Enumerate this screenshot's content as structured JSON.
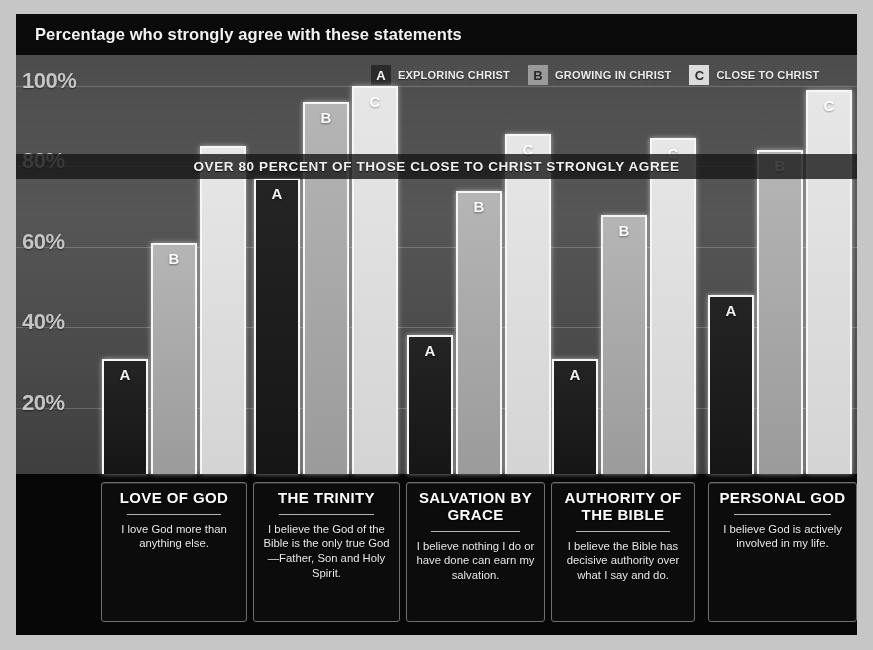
{
  "header": {
    "title": "Percentage who strongly agree with these statements"
  },
  "banner": {
    "text": "OVER 80 PERCENT OF THOSE CLOSE TO CHRIST STRONGLY AGREE"
  },
  "legend": [
    {
      "key": "A",
      "label": "EXPLORING CHRIST",
      "color": "#2a2a2a"
    },
    {
      "key": "B",
      "label": "GROWING IN CHRIST",
      "color": "#9a9a9a"
    },
    {
      "key": "C",
      "label": "CLOSE TO CHRIST",
      "color": "#dcdcdc"
    }
  ],
  "axis": {
    "ticks": [
      "100%",
      "80%",
      "60%",
      "40%",
      "20%"
    ]
  },
  "cards": [
    {
      "title": "LOVE OF GOD",
      "desc": "I love God more than anything else."
    },
    {
      "title": "THE TRINITY",
      "desc": "I believe the God of the Bible is the only true God—Father, Son and Holy Spirit."
    },
    {
      "title": "SALVATION BY GRACE",
      "desc": "I believe nothing I do or have done can earn my salvation."
    },
    {
      "title": "AUTHORITY OF THE BIBLE",
      "desc": "I believe the Bible has decisive authority over what I say and do."
    },
    {
      "title": "PERSONAL GOD",
      "desc": "I believe God is actively involved in my life."
    }
  ],
  "chart_data": {
    "type": "bar",
    "title": "Percentage who strongly agree with these statements",
    "xlabel": "",
    "ylabel": "",
    "ylim": [
      0,
      100
    ],
    "yticks": [
      20,
      40,
      60,
      80,
      100
    ],
    "ytick_labels": [
      "20%",
      "40%",
      "60%",
      "80%",
      "100%"
    ],
    "grid": true,
    "legend_position": "top-right",
    "annotation": "OVER 80 PERCENT OF THOSE CLOSE TO CHRIST STRONGLY AGREE",
    "annotation_value": 80,
    "categories": [
      "LOVE OF GOD",
      "THE TRINITY",
      "SALVATION BY GRACE",
      "AUTHORITY OF THE BIBLE",
      "PERSONAL GOD"
    ],
    "series": [
      {
        "name": "EXPLORING CHRIST",
        "key": "A",
        "color": "#2a2a2a",
        "values": [
          32,
          77,
          38,
          32,
          48
        ]
      },
      {
        "name": "GROWING IN CHRIST",
        "key": "B",
        "color": "#9a9a9a",
        "values": [
          61,
          96,
          74,
          68,
          84
        ]
      },
      {
        "name": "CLOSE TO CHRIST",
        "key": "C",
        "color": "#dcdcdc",
        "values": [
          85,
          100,
          88,
          87,
          99
        ]
      }
    ]
  }
}
